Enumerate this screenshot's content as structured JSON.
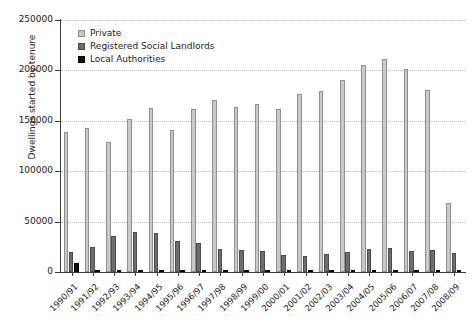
{
  "chart_data": {
    "type": "bar",
    "title": "",
    "xlabel": "",
    "ylabel": "Dwellings started by tenure",
    "ylim": [
      0,
      250000
    ],
    "yticks": [
      0,
      50000,
      100000,
      150000,
      200000,
      250000
    ],
    "ytick_labels": [
      "0",
      "50000",
      "100000",
      "150000",
      "200000",
      "250000"
    ],
    "grid": true,
    "legend_position": "upper left",
    "categories": [
      "1990/91",
      "1991/92",
      "1992/93",
      "1993/94",
      "1994/95",
      "1995/96",
      "1996/97",
      "1997/98",
      "1998/99",
      "1999/00",
      "2000/01",
      "2001/02",
      "2002/03",
      "2003/04",
      "2004/05",
      "2005/06",
      "2006/07",
      "2007/08",
      "2008/09"
    ],
    "series": [
      {
        "name": "Private",
        "color": "#c9c9c9",
        "values": [
          139000,
          143000,
          129000,
          152000,
          163000,
          141000,
          162000,
          171000,
          164000,
          167000,
          162000,
          177000,
          180000,
          190000,
          205000,
          211000,
          201000,
          181000,
          68000
        ]
      },
      {
        "name": "Registered Social Landlords",
        "color": "#6e6e6e",
        "values": [
          20000,
          25000,
          36000,
          40000,
          39000,
          31000,
          29000,
          23000,
          22000,
          21000,
          17000,
          16000,
          18000,
          20000,
          23000,
          24000,
          21000,
          22000,
          19000
        ]
      },
      {
        "name": "Local Authorities",
        "color": "#111111",
        "values": [
          9000,
          2000,
          1500,
          1500,
          1200,
          900,
          700,
          500,
          400,
          300,
          300,
          250,
          250,
          300,
          300,
          400,
          400,
          400,
          500
        ]
      }
    ]
  },
  "legend": {
    "items": [
      {
        "label": "Private"
      },
      {
        "label": "Registered Social Landlords"
      },
      {
        "label": "Local Authorities"
      }
    ]
  }
}
